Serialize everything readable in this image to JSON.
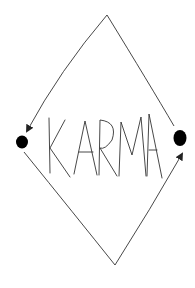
{
  "diagram": {
    "title": "KARMA",
    "label": "KARMA",
    "stroke_color": "#333333",
    "dot_color": "#000000",
    "nodes": [
      {
        "id": "left-dot",
        "x": 22,
        "y": 142
      },
      {
        "id": "right-dot",
        "x": 180,
        "y": 138
      },
      {
        "id": "top-apex",
        "x": 107,
        "y": 15
      },
      {
        "id": "bottom-apex",
        "x": 115,
        "y": 265
      }
    ],
    "edges": [
      {
        "from": "right-dot",
        "to": "top-apex",
        "arrow": false
      },
      {
        "from": "top-apex",
        "to": "left-dot",
        "arrow": true
      },
      {
        "from": "left-dot",
        "to": "bottom-apex",
        "arrow": false
      },
      {
        "from": "bottom-apex",
        "to": "right-dot",
        "arrow": true
      }
    ]
  }
}
